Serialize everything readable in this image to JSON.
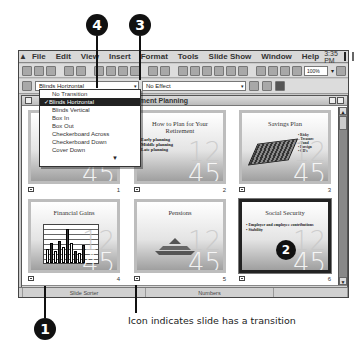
{
  "callouts": [
    {
      "id": "1",
      "label": "1"
    },
    {
      "id": "2",
      "label": "2"
    },
    {
      "id": "3",
      "label": "3"
    },
    {
      "id": "4",
      "label": "4"
    }
  ],
  "menubar": {
    "items": [
      "File",
      "Edit",
      "View",
      "Insert",
      "Format",
      "Tools",
      "Slide Show",
      "Window",
      "Help"
    ],
    "clock": "3:35 PM"
  },
  "toolbar": {
    "zoom_value": "100%"
  },
  "transition_toolbar": {
    "transition_value": "Blinds Horizontal",
    "effect_value": "No Effect"
  },
  "transition_dropdown": {
    "options": [
      {
        "label": "No Transition",
        "selected": false
      },
      {
        "label": "✓Blinds Horizontal",
        "selected": true
      },
      {
        "label": "Blinds Vertical",
        "selected": false
      },
      {
        "label": "Box In",
        "selected": false
      },
      {
        "label": "Box Out",
        "selected": false
      },
      {
        "label": "Checkerboard Across",
        "selected": false
      },
      {
        "label": "Checkerboard Down",
        "selected": false
      },
      {
        "label": "Cover Down",
        "selected": false
      }
    ],
    "more": "▼"
  },
  "document": {
    "title": "Retirement Planning",
    "slides": [
      {
        "number": "1",
        "title": "",
        "bullets": [],
        "has_transition": true,
        "selected": false
      },
      {
        "number": "2",
        "title": "How to Plan for Your Retirement",
        "bullets": [
          "Early planning",
          "Middle planning",
          "Late planning"
        ],
        "has_transition": true,
        "selected": false
      },
      {
        "number": "3",
        "title": "Savings Plan",
        "bullets": [
          "• Risky",
          "  – Treasure",
          "  – Fund",
          "• Foreign",
          "• CD's"
        ],
        "has_transition": true,
        "selected": false
      },
      {
        "number": "4",
        "title": "Financial Gains",
        "bullets": [],
        "has_transition": true,
        "selected": false
      },
      {
        "number": "5",
        "title": "Pensions",
        "bullets": [],
        "has_transition": true,
        "selected": false
      },
      {
        "number": "6",
        "title": "Social Security",
        "bullets": [
          "• Employer and employee contributions",
          "• Stability"
        ],
        "has_transition": true,
        "selected": true
      }
    ],
    "deco_top": "12",
    "deco_bottom": "45"
  },
  "statusbar": {
    "view": "Slide Sorter",
    "design": "Numbers"
  },
  "caption": "Icon indicates slide has a transition"
}
